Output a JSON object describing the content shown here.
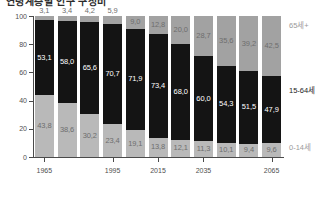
{
  "title": "연령계층별 인구 구성비",
  "chart_data": {
    "type": "bar",
    "subtype": "stacked-100-percent",
    "title": "연령계층별 인구 구성비",
    "xlabel": "",
    "ylabel": "",
    "ylim": [
      0,
      100
    ],
    "yticks": [
      0,
      20,
      40,
      60,
      80,
      100
    ],
    "grid": false,
    "legend_position": "right-inline",
    "categories": [
      "1965",
      "1975",
      "1985",
      "1995",
      "2005",
      "2015",
      "2025",
      "2035",
      "2045",
      "2055",
      "2065"
    ],
    "xtick_labels": [
      "1965",
      "1995",
      "2015",
      "2035",
      "2065"
    ],
    "series": [
      {
        "name": "0-14세",
        "color": "#b9b9b9",
        "values": [
          43.8,
          38.6,
          30.2,
          23.4,
          19.1,
          13.8,
          12.1,
          11.3,
          10.1,
          9.4,
          9.6
        ]
      },
      {
        "name": "15-64세",
        "color": "#141414",
        "values": [
          53.1,
          58.0,
          65.6,
          70.7,
          71.9,
          73.4,
          68.0,
          60.0,
          54.3,
          51.5,
          47.9
        ]
      },
      {
        "name": "65세+",
        "color": "#a2a2a2",
        "values": [
          3.1,
          3.4,
          4.2,
          5.9,
          9.0,
          12.8,
          20.0,
          28.7,
          35.6,
          39.2,
          42.5
        ]
      }
    ]
  },
  "annotations": {
    "old": "65세+",
    "work": "15-64세",
    "young": "0-14세"
  }
}
